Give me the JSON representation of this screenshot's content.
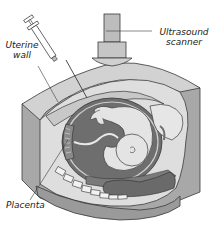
{
  "diagram": {
    "labels": {
      "uterine_wall_line1": "Uterine",
      "uterine_wall_line2": "wall",
      "ultrasound_line1": "Ultrasound",
      "ultrasound_line2": "scanner",
      "placenta": "Placenta"
    },
    "parts": [
      "syringe",
      "ultrasound-scanner",
      "uterine-wall",
      "amniotic-sac",
      "fetus",
      "placenta",
      "spine",
      "bowel"
    ],
    "colors": {
      "background": "#ffffff",
      "outline": "#3a3a3a",
      "tissue_light": "#d9d9d9",
      "tissue_mid": "#a8a8a8",
      "fluid_dark": "#6e6e6e",
      "fetus": "#e4e4e4",
      "scanner": "#bdbdbd",
      "bone": "#f2f2f2"
    }
  }
}
